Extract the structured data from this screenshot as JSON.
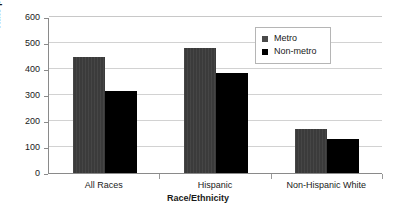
{
  "chart_data": {
    "type": "bar",
    "title": "",
    "xlabel": "Race/Ethnicity",
    "ylabel": "Rate per 100,000",
    "categories": [
      "All Races",
      "Hispanic",
      "Non-Hispanic White"
    ],
    "series": [
      {
        "name": "Metro",
        "values": [
          446,
          481,
          170
        ],
        "color": "#3b3b3b"
      },
      {
        "name": "Non-metro",
        "values": [
          316,
          385,
          131
        ],
        "color": "#000000"
      }
    ],
    "ylim": [
      0,
      600
    ],
    "yticks": [
      0,
      100,
      200,
      300,
      400,
      500,
      600
    ],
    "ytick_labels": [
      "0",
      "100",
      "200",
      "300",
      "400",
      "500",
      "600"
    ],
    "grid": "horizontal",
    "legend_position": "top-right"
  },
  "legend": {
    "entries": [
      {
        "label": "Metro",
        "swatch": "legend-swatch-metro"
      },
      {
        "label": "Non-metro",
        "swatch": "legend-swatch-nonmetro"
      }
    ]
  },
  "axes": {
    "y_title": "Rate per 100,000",
    "x_title": "Race/Ethnicity"
  }
}
